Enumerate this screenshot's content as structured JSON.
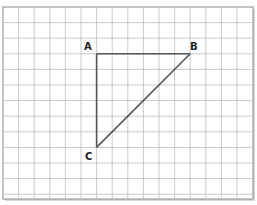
{
  "diagram": {
    "type": "triangle-on-grid",
    "grid": {
      "columns": 16,
      "rows": 12,
      "line_color": "#bdbdbd",
      "border_color": "#8a8a8a",
      "shadow_color": "#cfcfcf"
    },
    "line_color": "#555555",
    "points": [
      {
        "id": "A",
        "label": "A",
        "col": 6,
        "row": 3
      },
      {
        "id": "B",
        "label": "B",
        "col": 12,
        "row": 3
      },
      {
        "id": "C",
        "label": "C",
        "col": 6,
        "row": 9
      }
    ],
    "segments": [
      [
        "A",
        "B"
      ],
      [
        "A",
        "C"
      ],
      [
        "B",
        "C"
      ]
    ]
  }
}
